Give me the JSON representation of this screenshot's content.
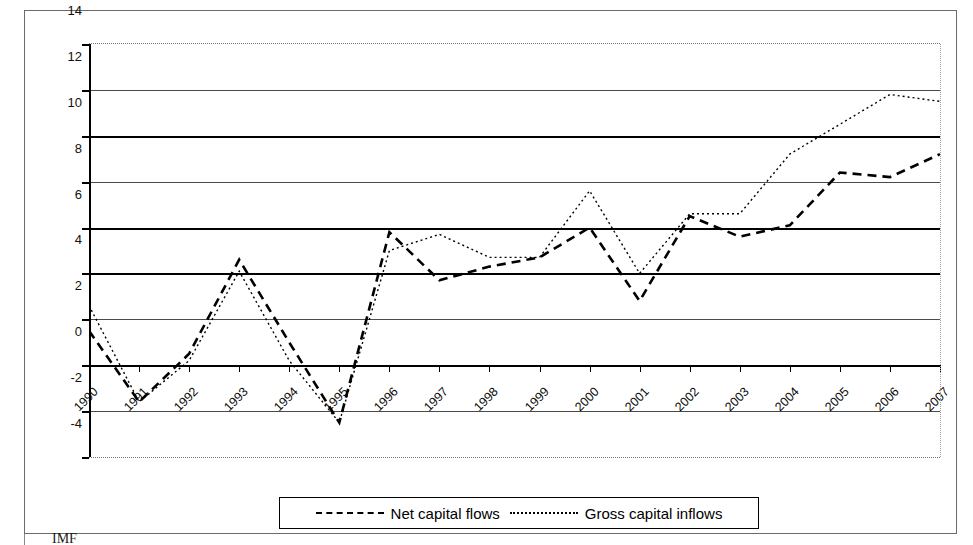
{
  "figure": {
    "footnote": "IMF",
    "border_color": "#6b6b6b"
  },
  "legend": {
    "position": "bottom-center",
    "entries": [
      {
        "label": "Net capital flows",
        "style": "dashed",
        "swatch": "dashed-line-swatch"
      },
      {
        "label": "Gross capital inflows",
        "style": "dotted",
        "swatch": "dotted-line-swatch"
      }
    ]
  },
  "chart_data": {
    "type": "line",
    "title": "",
    "subtitle": "",
    "xlabel": "",
    "ylabel": "",
    "grid": true,
    "legend_position": "bottom-center",
    "xlim": [
      1990,
      2007
    ],
    "ylim": [
      -4,
      14
    ],
    "ytick_step": 2,
    "yticks": [
      14,
      12,
      10,
      8,
      6,
      4,
      2,
      0,
      -2,
      -4
    ],
    "ytick_labels": [
      "14",
      "12",
      "10",
      "8",
      "6",
      "4",
      "2",
      "0",
      "-2",
      "-4"
    ],
    "categories": [
      "1990",
      "1991",
      "1992",
      "1993",
      "1994",
      "1995",
      "1996",
      "1997",
      "1998",
      "1999",
      "2000",
      "2001",
      "2002",
      "2003",
      "2004",
      "2005",
      "2006",
      "2007"
    ],
    "series": [
      {
        "name": "Net capital flows",
        "style": "dashed",
        "values": [
          1.5,
          -1.6,
          0.5,
          4.6,
          1.0,
          -2.5,
          5.8,
          3.7,
          4.3,
          4.7,
          6.0,
          2.8,
          6.5,
          5.6,
          6.1,
          8.4,
          8.2,
          9.2
        ]
      },
      {
        "name": "Gross capital inflows",
        "style": "dotted",
        "values": [
          2.6,
          -1.6,
          0.2,
          4.1,
          0.2,
          -2.5,
          5.0,
          5.7,
          4.7,
          4.7,
          7.6,
          4.0,
          6.6,
          6.6,
          9.2,
          10.5,
          11.8,
          11.5
        ]
      }
    ]
  }
}
